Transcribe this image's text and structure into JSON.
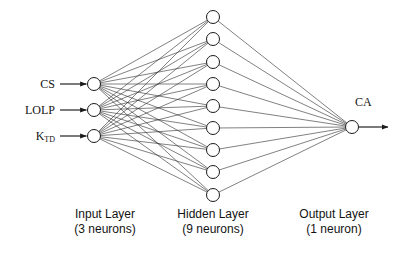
{
  "diagram": {
    "type": "neural-network-architecture",
    "background_color": "#ffffff",
    "stroke_color": "#1a1a1a",
    "node_fill": "#ffffff"
  },
  "inputs": [
    {
      "label": "CS",
      "sub": "",
      "node_x": 94,
      "node_y": 84
    },
    {
      "label": "LOLP",
      "sub": "",
      "node_x": 94,
      "node_y": 110
    },
    {
      "label": "K",
      "sub": "TD",
      "node_x": 94,
      "node_y": 136
    }
  ],
  "hidden": {
    "count": 9,
    "node_x": 213,
    "node_ys": [
      17,
      39,
      62,
      84,
      106,
      128,
      150,
      172,
      195
    ]
  },
  "output": {
    "label": "CA",
    "node_x": 352,
    "node_y": 127
  },
  "captions": {
    "input": {
      "line1": "Input Layer",
      "line2": "(3 neurons)"
    },
    "hidden": {
      "line1": "Hidden Layer",
      "line2": "(9 neurons)"
    },
    "output": {
      "line1": "Output Layer",
      "line2": "(1 neuron)"
    }
  },
  "chart_data": {
    "type": "diagram",
    "title": "",
    "layers": [
      {
        "name": "Input Layer",
        "neurons": 3,
        "labels": [
          "CS",
          "LOLP",
          "KTD"
        ]
      },
      {
        "name": "Hidden Layer",
        "neurons": 9,
        "labels": []
      },
      {
        "name": "Output Layer",
        "neurons": 1,
        "labels": [
          "CA"
        ]
      }
    ],
    "connections": "fully-connected",
    "edge_counts": {
      "input_to_hidden": 27,
      "hidden_to_output": 9
    }
  }
}
